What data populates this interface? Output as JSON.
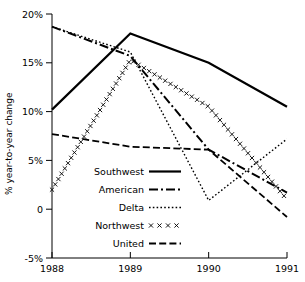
{
  "chart_data": {
    "type": "line",
    "title": "",
    "xlabel": "",
    "ylabel": "% year-to-year change",
    "x": [
      1988,
      1989,
      1990,
      1991
    ],
    "xtick_labels": [
      "1988",
      "1989",
      "1990",
      "1991"
    ],
    "ytick_labels": [
      "-5%",
      "0",
      "5%",
      "10%",
      "15%",
      "20%"
    ],
    "ytick_values": [
      -5,
      0,
      5,
      10,
      15,
      20
    ],
    "xlim": [
      1988,
      1991
    ],
    "ylim": [
      -5,
      20
    ],
    "grid": false,
    "legend_position": "inside-lower-left",
    "series": [
      {
        "name": "Southwest",
        "style": "solid",
        "marker": "none",
        "values": [
          10.2,
          18.0,
          15.0,
          10.5
        ]
      },
      {
        "name": "American",
        "style": "dash-dot",
        "marker": "none",
        "values": [
          18.7,
          15.7,
          6.1,
          1.7
        ]
      },
      {
        "name": "Delta",
        "style": "dotted",
        "marker": "none",
        "values": [
          18.7,
          16.1,
          0.9,
          7.2
        ]
      },
      {
        "name": "Northwest",
        "style": "cross",
        "marker": "x",
        "values": [
          2.0,
          15.3,
          10.5,
          1.0
        ]
      },
      {
        "name": "United",
        "style": "dashed",
        "marker": "none",
        "values": [
          7.7,
          6.4,
          6.1,
          -0.8
        ]
      }
    ],
    "colors": {
      "line": "#000000",
      "background": "#ffffff"
    }
  },
  "legend": {
    "items": [
      {
        "label": "Southwest"
      },
      {
        "label": "American"
      },
      {
        "label": "Delta"
      },
      {
        "label": "Northwest"
      },
      {
        "label": "United"
      }
    ]
  },
  "axes": {
    "y_title": "% year-to-year change",
    "y_ticks": [
      "20%",
      "15%",
      "10%",
      "5%",
      "0",
      "-5%"
    ],
    "x_ticks": [
      "1988",
      "1989",
      "1990",
      "1991"
    ]
  }
}
